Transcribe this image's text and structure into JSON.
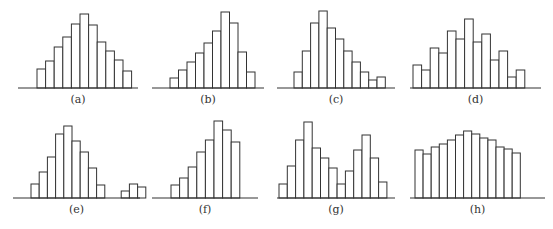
{
  "chart_data": [
    {
      "type": "bar",
      "label": "(a)",
      "axis": [
        18,
        138
      ],
      "baseline": 88,
      "x0": 37,
      "w": 8.6,
      "values": [
        19,
        27,
        41,
        51,
        64,
        74,
        63,
        46,
        37,
        28,
        17
      ]
    },
    {
      "type": "bar",
      "label": "(b)",
      "axis": [
        152,
        264
      ],
      "baseline": 88,
      "x0": 170,
      "w": 8.5,
      "values": [
        10,
        18,
        26,
        35,
        45,
        57,
        76,
        65,
        36,
        16
      ]
    },
    {
      "type": "bar",
      "label": "(c)",
      "axis": [
        277,
        395
      ],
      "baseline": 88,
      "x0": 294,
      "w": 8.3,
      "values": [
        16,
        37,
        65,
        77,
        60,
        49,
        37,
        26,
        16,
        8,
        11
      ]
    },
    {
      "type": "bar",
      "label": "(d)",
      "axis": [
        410,
        541
      ],
      "baseline": 88,
      "x0": 413,
      "w": 8.6,
      "values": [
        23,
        18,
        40,
        35,
        57,
        49,
        69,
        46,
        54,
        28,
        37,
        11,
        18
      ]
    },
    {
      "type": "bar",
      "label": "(e)",
      "axis": [
        13,
        140
      ],
      "baseline": 198,
      "x0": 31,
      "w": 8.2,
      "values": [
        14,
        26,
        41,
        64,
        72,
        57,
        46,
        30,
        13,
        0,
        0,
        7,
        14,
        11
      ]
    },
    {
      "type": "bar",
      "label": "(f)",
      "axis": [
        152,
        258
      ],
      "baseline": 198,
      "x0": 171,
      "w": 8.6,
      "values": [
        13,
        20,
        31,
        46,
        58,
        77,
        68,
        56
      ]
    },
    {
      "type": "bar",
      "label": "(g)",
      "axis": [
        277,
        395
      ],
      "baseline": 198,
      "x0": 279,
      "w": 8.3,
      "values": [
        14,
        32,
        58,
        76,
        50,
        40,
        30,
        14,
        27,
        48,
        63,
        40,
        16
      ]
    },
    {
      "type": "bar",
      "label": "(h)",
      "axis": [
        410,
        545
      ],
      "baseline": 198,
      "x0": 415,
      "w": 8.1,
      "values": [
        48,
        44,
        51,
        54,
        58,
        63,
        67,
        64,
        60,
        58,
        51,
        49,
        45
      ]
    }
  ]
}
